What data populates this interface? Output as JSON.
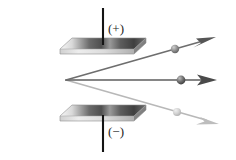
{
  "figure": {
    "background_color": "#ffffff",
    "width": 236,
    "height": 160,
    "labels": {
      "positive_plate": "(+)",
      "negative_plate": "(−)"
    },
    "colors": {
      "beam_dark": "#1a1a1a",
      "ray_upper": "#6e6e6e",
      "ray_middle": "#5a5a5a",
      "ray_lower": "#b4b4b4",
      "plate_top_light": "#f2f2f2",
      "plate_top_dark": "#4d4d4d",
      "plate_edge": "#8c8c8c",
      "wire": "#1a1a1a",
      "sphere_upper": "#8f8f8f",
      "sphere_middle": "#666666",
      "sphere_lower": "#cfcfcf"
    },
    "source_beam": {
      "name": "incoming-beam",
      "x1": 8,
      "y1": 80,
      "x2": 66,
      "y2": 80
    },
    "split_point": {
      "x": 66,
      "y": 80
    },
    "rays": [
      {
        "id": "ray-upper",
        "name": "deflected-ray-positive-particle",
        "label": "upper ray",
        "x1": 66,
        "y1": 80,
        "x2": 216,
        "y2": 37,
        "color": "#6e6e6e",
        "particle": {
          "cx": 175,
          "cy": 49,
          "r": 4.2,
          "color": "#8f8f8f"
        }
      },
      {
        "id": "ray-middle",
        "name": "undeflected-ray-neutral-particle",
        "label": "middle ray",
        "x1": 66,
        "y1": 80,
        "x2": 216,
        "y2": 80,
        "color": "#5a5a5a",
        "particle": {
          "cx": 181,
          "cy": 80,
          "r": 4.4,
          "color": "#666666"
        }
      },
      {
        "id": "ray-lower",
        "name": "deflected-ray-negative-particle",
        "label": "lower ray",
        "x1": 66,
        "y1": 80,
        "x2": 219,
        "y2": 124,
        "color": "#b4b4b4",
        "particle": {
          "cx": 177,
          "cy": 112,
          "r": 4.0,
          "color": "#cfcfcf"
        }
      }
    ],
    "plates": [
      {
        "id": "plate-top",
        "name": "positive-plate",
        "polarity": "(+)",
        "x": 60,
        "y": 38,
        "width": 86,
        "height": 12,
        "skew": 12
      },
      {
        "id": "plate-bottom",
        "name": "negative-plate",
        "polarity": "(−)",
        "x": 60,
        "y": 105,
        "width": 86,
        "height": 12,
        "skew": 12
      }
    ],
    "wires": [
      {
        "id": "wire-top",
        "name": "positive-terminal-wire",
        "x": 103,
        "y1": 8,
        "y2": 45
      },
      {
        "id": "wire-bottom",
        "name": "negative-terminal-wire",
        "x": 103,
        "y1": 115,
        "y2": 152
      }
    ]
  }
}
